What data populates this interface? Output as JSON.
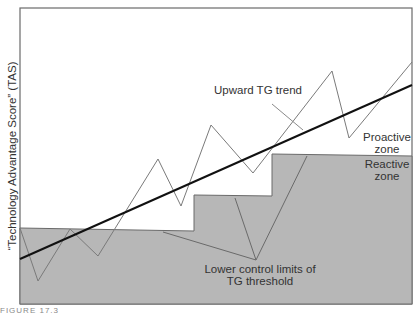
{
  "figure": {
    "y_axis_label": "“Technology Advantage Score” (TAS)",
    "labels": {
      "trend": "Upward TG trend",
      "proactive_line1": "Proactive",
      "proactive_line2": "zone",
      "reactive_line1": "Reactive",
      "reactive_line2": "zone",
      "lcl_line1": "Lower control limits of",
      "lcl_line2": "TG threshold"
    },
    "caption_fragment": "FIGURE 17.3",
    "colors": {
      "reactive_fill": "#b7b7b7",
      "frame": "#6a6a6a",
      "trend_line": "#111111",
      "series_line": "#777777"
    }
  }
}
